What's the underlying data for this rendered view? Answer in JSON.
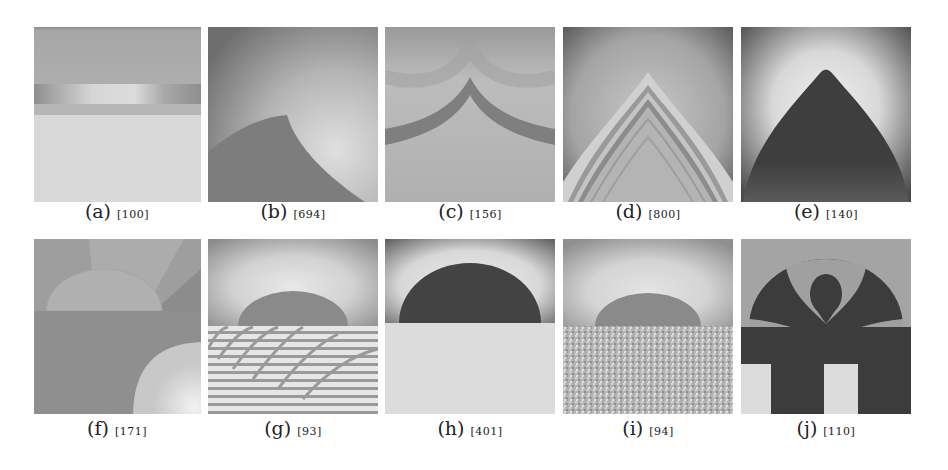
{
  "figure": {
    "panels": [
      {
        "id": "a",
        "label": "(a)",
        "value": "[100]"
      },
      {
        "id": "b",
        "label": "(b)",
        "value": "[694]"
      },
      {
        "id": "c",
        "label": "(c)",
        "value": "[156]"
      },
      {
        "id": "d",
        "label": "(d)",
        "value": "[800]"
      },
      {
        "id": "e",
        "label": "(e)",
        "value": "[140]"
      },
      {
        "id": "f",
        "label": "(f)",
        "value": "[171]"
      },
      {
        "id": "g",
        "label": "(g)",
        "value": "[93]"
      },
      {
        "id": "h",
        "label": "(h)",
        "value": "[401]"
      },
      {
        "id": "i",
        "label": "(i)",
        "value": "[94]"
      },
      {
        "id": "j",
        "label": "(j)",
        "value": "[110]"
      }
    ]
  }
}
